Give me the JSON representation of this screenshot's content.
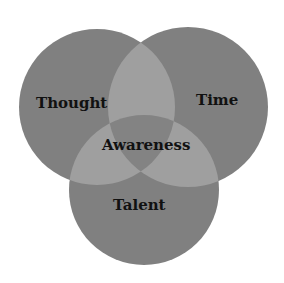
{
  "diagram": {
    "type": "venn",
    "sets": [
      {
        "label": "Thought",
        "cx": 97,
        "cy": 107,
        "r": 78
      },
      {
        "label": "Time",
        "cx": 188,
        "cy": 107,
        "r": 80
      },
      {
        "label": "Talent",
        "cx": 144,
        "cy": 190,
        "r": 75
      }
    ],
    "center_label": "Awareness",
    "colors": {
      "circle": "#808080",
      "pair_overlap": "#9f9f9f",
      "triple_overlap": "#838383",
      "text": "#111111",
      "background": "#ffffff"
    }
  }
}
